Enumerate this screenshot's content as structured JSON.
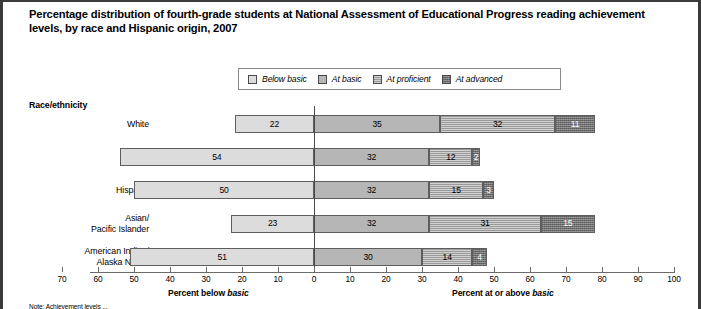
{
  "title": "Percentage distribution of fourth-grade students at National Assessment of Educational Progress reading achievement levels, by race and Hispanic origin, 2007",
  "axis_group_header": "Race/ethnicity",
  "legend": {
    "items": [
      {
        "label": "Below basic",
        "key": "below"
      },
      {
        "label": "At basic",
        "key": "basic"
      },
      {
        "label": "At proficient",
        "key": "proficient"
      },
      {
        "label": "At advanced",
        "key": "advanced"
      }
    ]
  },
  "axis": {
    "left_caption_prefix": "Percent below ",
    "left_caption_italic": "basic",
    "right_caption_prefix": "Percent at or above ",
    "right_caption_italic": "basic",
    "ticks": [
      70,
      60,
      50,
      40,
      30,
      20,
      10,
      0,
      10,
      20,
      30,
      40,
      50,
      60,
      70,
      80,
      90,
      100
    ]
  },
  "note": "Note: Achievement levels ...",
  "chart_data": {
    "type": "bar",
    "title": "Percentage distribution of fourth-grade students at National Assessment of Educational Progress reading achievement levels, by race and Hispanic origin, 2007",
    "orientation": "horizontal",
    "stacked": true,
    "diverging_at": "below-basic boundary",
    "xlabel_left": "Percent below basic",
    "xlabel_right": "Percent at or above basic",
    "ylabel": "Race/ethnicity",
    "xlim": [
      -70,
      100
    ],
    "xticks": [
      70,
      60,
      50,
      40,
      30,
      20,
      10,
      0,
      10,
      20,
      30,
      40,
      50,
      60,
      70,
      80,
      90,
      100
    ],
    "grid": false,
    "legend_position": "top-center",
    "categories": [
      "White",
      "Black",
      "Hispanic",
      "Asian/\nPacific Islander",
      "American Indian/\nAlaska Native"
    ],
    "series": [
      {
        "name": "Below basic",
        "values": [
          22,
          54,
          50,
          23,
          51
        ]
      },
      {
        "name": "At basic",
        "values": [
          35,
          32,
          32,
          32,
          30
        ]
      },
      {
        "name": "At proficient",
        "values": [
          32,
          12,
          15,
          31,
          14
        ]
      },
      {
        "name": "At advanced",
        "values": [
          11,
          2,
          3,
          15,
          4
        ]
      }
    ],
    "rows": [
      {
        "label": "White",
        "label_lines": [
          "White"
        ],
        "below": 22,
        "basic": 35,
        "proficient": 32,
        "advanced": 11
      },
      {
        "label": "Black",
        "label_lines": [
          "Black"
        ],
        "below": 54,
        "basic": 32,
        "proficient": 12,
        "advanced": 2
      },
      {
        "label": "Hispanic",
        "label_lines": [
          "Hispanic"
        ],
        "below": 50,
        "basic": 32,
        "proficient": 15,
        "advanced": 3
      },
      {
        "label": "Asian/Pacific Islander",
        "label_lines": [
          "Asian/",
          "Pacific Islander"
        ],
        "below": 23,
        "basic": 32,
        "proficient": 31,
        "advanced": 15
      },
      {
        "label": "American Indian/Alaska Native",
        "label_lines": [
          "American Indian/",
          "Alaska Native"
        ],
        "below": 51,
        "basic": 30,
        "proficient": 14,
        "advanced": 4
      }
    ]
  },
  "colors": {
    "below": "#dcdcdc",
    "basic": "#b6b6b6",
    "proficient": "#9a9a9a",
    "advanced": "#6e6e6e",
    "outline": "#5e5e5e"
  }
}
